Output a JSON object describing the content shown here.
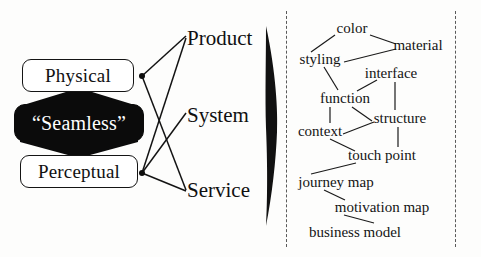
{
  "diagram": {
    "colors": {
      "ink": "#111111",
      "fill": "#0b0b0b",
      "paper": "#fdfdfc",
      "rail": "#5a5a5a"
    },
    "left_panel": {
      "boxes": [
        {
          "id": "physical",
          "label": "Physical",
          "style": "outline"
        },
        {
          "id": "seamless",
          "label": "“Seamless”",
          "style": "filled"
        },
        {
          "id": "perceptual",
          "label": "Perceptual",
          "style": "outline"
        }
      ],
      "arrows": [
        {
          "id": "arrow-up",
          "direction": "up",
          "from": "seamless",
          "to": "physical"
        },
        {
          "id": "arrow-down",
          "direction": "down",
          "from": "seamless",
          "to": "perceptual"
        }
      ],
      "offering_labels": [
        {
          "id": "product",
          "label": "Product"
        },
        {
          "id": "system",
          "label": "System"
        },
        {
          "id": "service",
          "label": "Service"
        }
      ],
      "connector_edges": [
        {
          "from": "physical",
          "to": "product"
        },
        {
          "from": "physical",
          "to": "service"
        },
        {
          "from": "perceptual",
          "to": "product"
        },
        {
          "from": "perceptual",
          "to": "system"
        },
        {
          "from": "perceptual",
          "to": "service"
        }
      ]
    },
    "divider": {
      "id": "wedge",
      "shape": "tall-lens-arrow",
      "direction": "right"
    },
    "right_panel": {
      "rails": [
        "left-dashed-rail",
        "right-dashed-rail"
      ],
      "nodes": [
        {
          "id": "color",
          "label": "color",
          "x": 352,
          "y": 28
        },
        {
          "id": "material",
          "label": "material",
          "x": 418,
          "y": 45
        },
        {
          "id": "styling",
          "label": "styling",
          "x": 320,
          "y": 59
        },
        {
          "id": "interface",
          "label": "interface",
          "x": 391,
          "y": 73
        },
        {
          "id": "function",
          "label": "function",
          "x": 345,
          "y": 98
        },
        {
          "id": "structure",
          "label": "structure",
          "x": 400,
          "y": 118
        },
        {
          "id": "context",
          "label": "context",
          "x": 320,
          "y": 131
        },
        {
          "id": "touch-point",
          "label": "touch point",
          "x": 382,
          "y": 155
        },
        {
          "id": "journey-map",
          "label": "journey map",
          "x": 336,
          "y": 182
        },
        {
          "id": "motivation-map",
          "label": "motivation map",
          "x": 382,
          "y": 207
        },
        {
          "id": "business-model",
          "label": "business model",
          "x": 355,
          "y": 232
        }
      ],
      "edges": [
        {
          "from": "color",
          "to": "styling"
        },
        {
          "from": "color",
          "to": "material"
        },
        {
          "from": "styling",
          "to": "material"
        },
        {
          "from": "styling",
          "to": "function"
        },
        {
          "from": "function",
          "to": "interface"
        },
        {
          "from": "interface",
          "to": "structure"
        },
        {
          "from": "function",
          "to": "context"
        },
        {
          "from": "function",
          "to": "structure"
        },
        {
          "from": "context",
          "to": "structure"
        },
        {
          "from": "structure",
          "to": "touch-point"
        },
        {
          "from": "context",
          "to": "touch-point"
        },
        {
          "from": "touch-point",
          "to": "journey-map"
        },
        {
          "from": "journey-map",
          "to": "motivation-map"
        },
        {
          "from": "motivation-map",
          "to": "business-model"
        }
      ]
    }
  }
}
